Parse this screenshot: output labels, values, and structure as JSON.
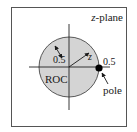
{
  "diagram": {
    "title": "z-plane",
    "title_italic_part": "z",
    "title_rest": "-plane",
    "roc_label": "ROC",
    "inner_radius_label": "0.5",
    "pole_position_label": "0.5",
    "vector_label": "z",
    "pole_label": "pole",
    "colors": {
      "roc_fill": "#d4d4d4",
      "frame": "#555555",
      "axis": "#222222",
      "pole": "#000000"
    }
  }
}
